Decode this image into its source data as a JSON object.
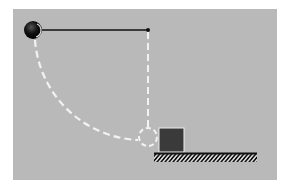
{
  "diagram": {
    "type": "physics-pendulum-collision",
    "colors": {
      "page": "#ffffff",
      "panel": "#b9b9b9",
      "string": "#111111",
      "ball": "#111111",
      "dashed_path": "#f2f2f2",
      "block": "#3a3a3a",
      "ground": "#111111"
    },
    "elements": {
      "pivot": {
        "x": 148,
        "y": 30
      },
      "ball_start": {
        "x": 33,
        "y": 30,
        "r": 9
      },
      "ball_end": {
        "x": 148,
        "y": 137,
        "r": 9
      },
      "block": {
        "x": 159,
        "y": 128,
        "w": 25,
        "h": 24
      },
      "ground": {
        "x1": 154,
        "x2": 257,
        "y": 153
      }
    }
  }
}
